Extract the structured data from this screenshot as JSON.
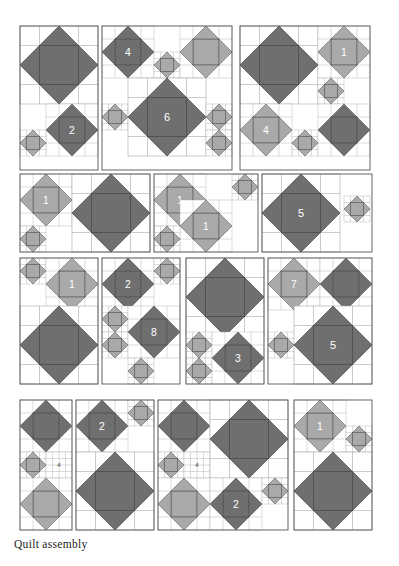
{
  "figure": {
    "caption": "Quilt assembly",
    "width": 399,
    "height": 566
  },
  "colors": {
    "background": "#ffffff",
    "dark_star": "#6f6f6f",
    "light_star": "#a9a9a9",
    "outline": "#4a4a4a",
    "grid_line": "#9a9a9a",
    "block_border": "#555555",
    "label_light": "#ffffff",
    "label_dark": "#3a3a3a",
    "caption_color": "#1d1d1d"
  },
  "legend": {
    "star_types": [
      {
        "name": "dark-star",
        "color": "#6f6f6f"
      },
      {
        "name": "light-star",
        "color": "#a9a9a9"
      }
    ]
  },
  "rows": [
    {
      "name": "row-1",
      "y": 26,
      "height": 144,
      "blocks": [
        {
          "name": "block-r1-c1",
          "x": 20,
          "y": 26,
          "w": 78,
          "h": 144,
          "stars": [
            {
              "name": "star-large-dark",
              "x": 20,
              "y": 26,
              "size": 78,
              "tone": "dark",
              "label": ""
            },
            {
              "name": "star-medium-dark",
              "x": 46,
              "y": 104,
              "size": 52,
              "tone": "dark",
              "label": "2"
            },
            {
              "name": "star-small-light",
              "x": 20,
              "y": 130,
              "size": 26,
              "tone": "light",
              "label": ""
            }
          ]
        },
        {
          "name": "block-r1-c2",
          "x": 102,
          "y": 26,
          "w": 130,
          "h": 144,
          "stars": [
            {
              "name": "star-medium-dark",
              "x": 102,
              "y": 26,
              "size": 52,
              "tone": "dark",
              "label": "4"
            },
            {
              "name": "star-small-light",
              "x": 154,
              "y": 52,
              "size": 26,
              "tone": "light",
              "label": ""
            },
            {
              "name": "star-medium-light",
              "x": 180,
              "y": 26,
              "size": 52,
              "tone": "light",
              "label": ""
            },
            {
              "name": "star-small-light-left",
              "x": 102,
              "y": 104,
              "size": 26,
              "tone": "light",
              "label": ""
            },
            {
              "name": "star-large-dark",
              "x": 128,
              "y": 78,
              "size": 78,
              "tone": "dark",
              "label": "6"
            },
            {
              "name": "star-small-light-right-top",
              "x": 206,
              "y": 104,
              "size": 26,
              "tone": "light",
              "label": ""
            },
            {
              "name": "star-small-light-right-bottom",
              "x": 206,
              "y": 130,
              "size": 26,
              "tone": "light",
              "label": ""
            }
          ]
        },
        {
          "name": "block-r1-c3",
          "x": 240,
          "y": 26,
          "w": 130,
          "h": 144,
          "stars": [
            {
              "name": "star-large-dark",
              "x": 240,
              "y": 26,
              "size": 78,
              "tone": "dark",
              "label": ""
            },
            {
              "name": "star-medium-light",
              "x": 318,
              "y": 26,
              "size": 52,
              "tone": "light",
              "label": "1"
            },
            {
              "name": "star-small-light",
              "x": 318,
              "y": 78,
              "size": 26,
              "tone": "light",
              "label": ""
            },
            {
              "name": "star-medium-light-lower",
              "x": 240,
              "y": 104,
              "size": 52,
              "tone": "light",
              "label": "4"
            },
            {
              "name": "star-small-light-lower",
              "x": 292,
              "y": 130,
              "size": 26,
              "tone": "light",
              "label": ""
            },
            {
              "name": "star-medium-dark-lower",
              "x": 318,
              "y": 104,
              "size": 52,
              "tone": "dark",
              "label": ""
            }
          ]
        }
      ]
    },
    {
      "name": "row-2",
      "y": 174,
      "height": 78,
      "blocks": [
        {
          "name": "block-r2-c1",
          "x": 20,
          "y": 174,
          "w": 130,
          "h": 78,
          "stars": [
            {
              "name": "star-medium-light",
              "x": 20,
              "y": 174,
              "size": 52,
              "tone": "light",
              "label": "1"
            },
            {
              "name": "star-small-light",
              "x": 20,
              "y": 226,
              "size": 26,
              "tone": "light",
              "label": ""
            },
            {
              "name": "star-large-dark",
              "x": 72,
              "y": 174,
              "size": 78,
              "tone": "dark",
              "label": ""
            }
          ]
        },
        {
          "name": "block-r2-c2",
          "x": 154,
          "y": 174,
          "w": 104,
          "h": 78,
          "stars": [
            {
              "name": "star-medium-light",
              "x": 154,
              "y": 174,
              "size": 52,
              "tone": "light",
              "label": "1"
            },
            {
              "name": "star-small-light-top",
              "x": 232,
              "y": 174,
              "size": 26,
              "tone": "light",
              "label": ""
            },
            {
              "name": "star-medium-light-lower",
              "x": 180,
              "y": 200,
              "size": 52,
              "tone": "light",
              "label": "1"
            },
            {
              "name": "star-small-light-bottom",
              "x": 154,
              "y": 226,
              "size": 26,
              "tone": "light",
              "label": ""
            }
          ]
        },
        {
          "name": "block-r2-c3",
          "x": 262,
          "y": 174,
          "w": 110,
          "h": 78,
          "stars": [
            {
              "name": "star-large-dark",
              "x": 262,
              "y": 174,
              "size": 78,
              "tone": "dark",
              "label": "5"
            },
            {
              "name": "star-small-light",
              "x": 344,
              "y": 196,
              "size": 26,
              "tone": "light",
              "label": ""
            }
          ]
        }
      ]
    },
    {
      "name": "row-3",
      "y": 258,
      "height": 126,
      "blocks": [
        {
          "name": "block-r3-c1",
          "x": 20,
          "y": 258,
          "w": 78,
          "h": 126,
          "stars": [
            {
              "name": "star-small-light",
              "x": 20,
              "y": 258,
              "size": 26,
              "tone": "light",
              "label": ""
            },
            {
              "name": "star-medium-light",
              "x": 46,
              "y": 258,
              "size": 52,
              "tone": "light",
              "label": "1"
            },
            {
              "name": "star-large-dark",
              "x": 20,
              "y": 306,
              "size": 78,
              "tone": "dark",
              "label": ""
            }
          ]
        },
        {
          "name": "block-r3-c2",
          "x": 102,
          "y": 258,
          "w": 78,
          "h": 126,
          "stars": [
            {
              "name": "star-medium-dark",
              "x": 102,
              "y": 258,
              "size": 52,
              "tone": "dark",
              "label": "2"
            },
            {
              "name": "star-small-light-top-right",
              "x": 154,
              "y": 258,
              "size": 26,
              "tone": "light",
              "label": ""
            },
            {
              "name": "star-small-light-mid-a",
              "x": 102,
              "y": 306,
              "size": 26,
              "tone": "light",
              "label": ""
            },
            {
              "name": "star-small-light-mid-b",
              "x": 102,
              "y": 332,
              "size": 26,
              "tone": "light",
              "label": ""
            },
            {
              "name": "star-medium-dark-lower",
              "x": 128,
              "y": 306,
              "size": 52,
              "tone": "dark",
              "label": "8"
            },
            {
              "name": "star-small-light-bottom",
              "x": 128,
              "y": 358,
              "size": 26,
              "tone": "light",
              "label": ""
            }
          ]
        },
        {
          "name": "block-r3-c3",
          "x": 186,
          "y": 258,
          "w": 78,
          "h": 126,
          "stars": [
            {
              "name": "star-large-dark",
              "x": 186,
              "y": 258,
              "size": 78,
              "tone": "dark",
              "label": ""
            },
            {
              "name": "star-small-light-a",
              "x": 186,
              "y": 332,
              "size": 26,
              "tone": "light",
              "label": ""
            },
            {
              "name": "star-small-light-b",
              "x": 186,
              "y": 358,
              "size": 26,
              "tone": "light",
              "label": ""
            },
            {
              "name": "star-medium-dark-lower",
              "x": 212,
              "y": 332,
              "size": 52,
              "tone": "dark",
              "label": "3"
            }
          ]
        },
        {
          "name": "block-r3-c4",
          "x": 268,
          "y": 258,
          "w": 104,
          "h": 126,
          "stars": [
            {
              "name": "star-medium-light",
              "x": 268,
              "y": 258,
              "size": 52,
              "tone": "light",
              "label": "7"
            },
            {
              "name": "star-medium-dark-top",
              "x": 320,
              "y": 258,
              "size": 52,
              "tone": "dark",
              "label": ""
            },
            {
              "name": "star-small-light-left",
              "x": 268,
              "y": 332,
              "size": 26,
              "tone": "light",
              "label": ""
            },
            {
              "name": "star-large-dark",
              "x": 294,
              "y": 306,
              "size": 78,
              "tone": "dark",
              "label": "5"
            }
          ]
        }
      ]
    },
    {
      "name": "row-4",
      "y": 400,
      "height": 130,
      "blocks": [
        {
          "name": "block-r4-c1",
          "x": 20,
          "y": 400,
          "w": 52,
          "h": 130,
          "stars": [
            {
              "name": "star-medium-dark",
              "x": 20,
              "y": 400,
              "size": 52,
              "tone": "dark",
              "label": ""
            },
            {
              "name": "star-small-light",
              "x": 20,
              "y": 452,
              "size": 26,
              "tone": "light",
              "label": ""
            },
            {
              "name": "label-square",
              "x": 46,
              "y": 452,
              "size": 26,
              "tone": "blank",
              "label": "4"
            },
            {
              "name": "star-medium-light-lower",
              "x": 20,
              "y": 478,
              "size": 52,
              "tone": "light",
              "label": ""
            }
          ]
        },
        {
          "name": "block-r4-c2",
          "x": 76,
          "y": 400,
          "w": 78,
          "h": 130,
          "stars": [
            {
              "name": "star-medium-dark",
              "x": 76,
              "y": 400,
              "size": 52,
              "tone": "dark",
              "label": "2"
            },
            {
              "name": "star-small-light",
              "x": 128,
              "y": 400,
              "size": 26,
              "tone": "light",
              "label": ""
            },
            {
              "name": "star-large-dark-lower",
              "x": 76,
              "y": 452,
              "size": 78,
              "tone": "dark",
              "label": ""
            }
          ]
        },
        {
          "name": "block-r4-c3",
          "x": 158,
          "y": 400,
          "w": 130,
          "h": 130,
          "stars": [
            {
              "name": "star-medium-dark-top",
              "x": 158,
              "y": 400,
              "size": 52,
              "tone": "dark",
              "label": ""
            },
            {
              "name": "star-small-light-left",
              "x": 158,
              "y": 452,
              "size": 26,
              "tone": "light",
              "label": ""
            },
            {
              "name": "label-square",
              "x": 184,
              "y": 452,
              "size": 26,
              "tone": "blank",
              "label": "4"
            },
            {
              "name": "star-large-dark-right",
              "x": 210,
              "y": 400,
              "size": 78,
              "tone": "dark",
              "label": ""
            },
            {
              "name": "star-medium-light-lower",
              "x": 158,
              "y": 478,
              "size": 52,
              "tone": "light",
              "label": ""
            },
            {
              "name": "star-medium-dark-lower",
              "x": 210,
              "y": 478,
              "size": 52,
              "tone": "dark",
              "label": "2"
            },
            {
              "name": "star-small-light-bottom-right",
              "x": 262,
              "y": 478,
              "size": 26,
              "tone": "light",
              "label": ""
            }
          ]
        },
        {
          "name": "block-r4-c4",
          "x": 294,
          "y": 400,
          "w": 78,
          "h": 130,
          "stars": [
            {
              "name": "star-medium-light",
              "x": 294,
              "y": 400,
              "size": 52,
              "tone": "light",
              "label": "1"
            },
            {
              "name": "star-small-light",
              "x": 346,
              "y": 426,
              "size": 26,
              "tone": "light",
              "label": ""
            },
            {
              "name": "star-large-dark",
              "x": 294,
              "y": 452,
              "size": 78,
              "tone": "dark",
              "label": ""
            }
          ]
        }
      ]
    }
  ]
}
